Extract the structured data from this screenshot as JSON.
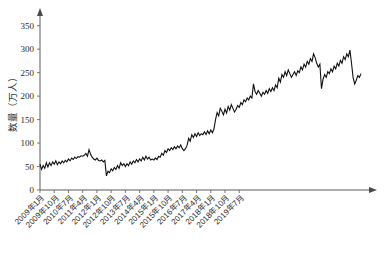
{
  "chart_data": {
    "type": "line",
    "title": "",
    "xlabel": "",
    "ylabel": "数量（万人）",
    "ylim": [
      0,
      375
    ],
    "yticks": [
      0,
      50,
      100,
      150,
      200,
      250,
      300,
      350
    ],
    "grid": false,
    "legend": false,
    "x_tick_labels": [
      "2009年1月",
      "2009年10月",
      "2010年7月",
      "2011年4月",
      "2012年1月",
      "2012年10月",
      "2013年7月",
      "2014年4月",
      "2015年1月",
      "2015年10月",
      "2016年7月",
      "2017年4月",
      "2018年1月",
      "2018年10月",
      "2019年7月"
    ],
    "x_tick_indices": [
      0,
      9,
      18,
      27,
      36,
      45,
      54,
      63,
      72,
      81,
      90,
      99,
      108,
      117,
      126
    ],
    "x_start": "2009年1月",
    "x_end": "2019年12月",
    "series": [
      {
        "name": "数量（万人）",
        "color": "#111111",
        "values": [
          55,
          44,
          52,
          46,
          58,
          49,
          58,
          52,
          60,
          55,
          62,
          54,
          60,
          56,
          62,
          58,
          63,
          60,
          66,
          62,
          68,
          65,
          70,
          67,
          71,
          70,
          73,
          72,
          74,
          78,
          72,
          86,
          76,
          70,
          66,
          64,
          68,
          63,
          62,
          64,
          60,
          63,
          30,
          40,
          37,
          45,
          41,
          48,
          44,
          52,
          46,
          58,
          52,
          56,
          50,
          56,
          52,
          60,
          55,
          62,
          58,
          65,
          60,
          66,
          62,
          70,
          64,
          72,
          66,
          70,
          64,
          66,
          64,
          68,
          65,
          72,
          70,
          78,
          74,
          84,
          80,
          88,
          84,
          90,
          86,
          92,
          88,
          94,
          90,
          96,
          88,
          84,
          88,
          95,
          110,
          104,
          118,
          112,
          120,
          114,
          122,
          116,
          120,
          118,
          124,
          118,
          126,
          120,
          128,
          122,
          130,
          150,
          165,
          158,
          174,
          168,
          160,
          172,
          164,
          178,
          170,
          182,
          174,
          166,
          172,
          180,
          176,
          186,
          182,
          192,
          188,
          196,
          192,
          200,
          196,
          226,
          210,
          204,
          212,
          206,
          200,
          208,
          204,
          212,
          206,
          216,
          210,
          218,
          212,
          224,
          218,
          238,
          230,
          246,
          240,
          252,
          244,
          256,
          248,
          240,
          246,
          252,
          244,
          254,
          250,
          262,
          256,
          268,
          262,
          274,
          268,
          280,
          274,
          290,
          282,
          270,
          262,
          268,
          216,
          236,
          246,
          240,
          252,
          248,
          258,
          252,
          264,
          258,
          270,
          264,
          276,
          270,
          284,
          278,
          290,
          284,
          298,
          270,
          240,
          226,
          234,
          244,
          240,
          248
        ]
      }
    ]
  }
}
